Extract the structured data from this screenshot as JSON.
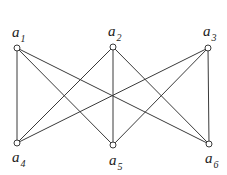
{
  "diagram": {
    "type": "bipartite-graph",
    "nodes": [
      {
        "id": "a1",
        "base": "a",
        "sub": "1",
        "x": 17,
        "y": 48,
        "lx": 12,
        "ly": 37
      },
      {
        "id": "a2",
        "base": "a",
        "sub": "2",
        "x": 113,
        "y": 47,
        "lx": 108,
        "ly": 36
      },
      {
        "id": "a3",
        "base": "a",
        "sub": "3",
        "x": 208,
        "y": 48,
        "lx": 203,
        "ly": 36
      },
      {
        "id": "a4",
        "base": "a",
        "sub": "4",
        "x": 17,
        "y": 143,
        "lx": 12,
        "ly": 162
      },
      {
        "id": "a5",
        "base": "a",
        "sub": "5",
        "x": 113,
        "y": 145,
        "lx": 109,
        "ly": 165
      },
      {
        "id": "a6",
        "base": "a",
        "sub": "6",
        "x": 209,
        "y": 144,
        "lx": 205,
        "ly": 163
      }
    ],
    "edges": [
      [
        "a1",
        "a4"
      ],
      [
        "a1",
        "a5"
      ],
      [
        "a1",
        "a6"
      ],
      [
        "a2",
        "a4"
      ],
      [
        "a2",
        "a5"
      ],
      [
        "a2",
        "a6"
      ],
      [
        "a3",
        "a4"
      ],
      [
        "a3",
        "a5"
      ],
      [
        "a3",
        "a6"
      ]
    ]
  }
}
